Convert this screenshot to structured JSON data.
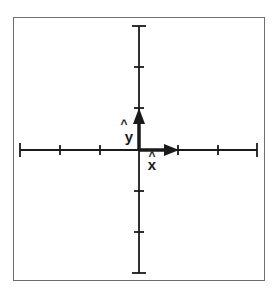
{
  "diagram": {
    "title": "",
    "colors": {
      "axis": "#1a1a1a",
      "vector": "#1a1a1a",
      "border": "#6e6e6e"
    },
    "axes": {
      "x_ticks": [
        -3,
        -2,
        -1,
        0,
        1,
        2,
        3
      ],
      "y_ticks": [
        -3,
        -2,
        -1,
        0,
        1,
        2,
        3
      ]
    },
    "vectors": [
      {
        "name": "x-hat",
        "label": "x",
        "hat": "^",
        "from": [
          0,
          0
        ],
        "to": [
          1,
          0
        ]
      },
      {
        "name": "y-hat",
        "label": "y",
        "hat": "^",
        "from": [
          0,
          0
        ],
        "to": [
          0,
          1
        ]
      }
    ]
  },
  "labels": {
    "x_unit": "x",
    "x_unit_hat": "^",
    "y_unit": "y",
    "y_unit_hat": "^"
  }
}
